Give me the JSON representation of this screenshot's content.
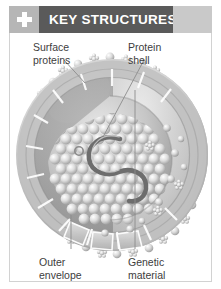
{
  "header": {
    "title": "KEY STRUCTURES",
    "icon": "plus-icon",
    "bar_color": "#5a5a5a",
    "accent_color": "#c9c9c9",
    "icon_box_color": "#b6b6b6"
  },
  "figure": {
    "style": "grayscale",
    "labels": [
      {
        "id": "surface-proteins",
        "line1": "Surface",
        "line2": "proteins",
        "position": "top-left"
      },
      {
        "id": "protein-shell",
        "line1": "Protein",
        "line2": "shell",
        "position": "top-right"
      },
      {
        "id": "outer-envelope",
        "line1": "Outer",
        "line2": "envelope",
        "position": "bottom-left"
      },
      {
        "id": "genetic-material",
        "line1": "Genetic",
        "line2": "material",
        "position": "bottom-right"
      }
    ],
    "colors": {
      "envelope": "#b9b9b9",
      "capsid": "#a8a8a8",
      "core": "#c4c4c4",
      "rna": "#6d6d6d",
      "spike": "#d6d6d6",
      "leader_line": "#8c8c8c",
      "border": "#d2d2d2"
    }
  }
}
